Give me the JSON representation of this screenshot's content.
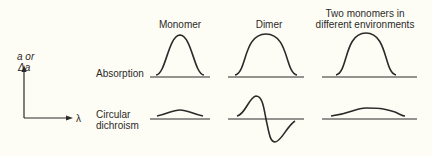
{
  "axis": {
    "y_label_line1": "a or",
    "y_label_line2": "Δa",
    "x_label": "λ"
  },
  "columns": [
    {
      "label_line1": "Monomer",
      "label_line2": ""
    },
    {
      "label_line1": "Dimer",
      "label_line2": ""
    },
    {
      "label_line1": "Two monomers in",
      "label_line2": "different environments"
    }
  ],
  "rows": [
    {
      "label_line1": "Absorption",
      "label_line2": ""
    },
    {
      "label_line1": "Circular",
      "label_line2": "dichroism"
    }
  ],
  "colors": {
    "background": "#fefdf5",
    "ink": "#2a2a2a"
  }
}
